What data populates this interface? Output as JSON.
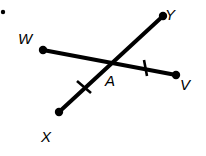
{
  "figure": {
    "title": "Intersecting segments WV and XY meeting at point A",
    "canvas": {
      "width": 206,
      "height": 156
    },
    "colors": {
      "background": "#ffffff",
      "stroke": "#000000",
      "label": "#000000"
    },
    "style": {
      "segment_stroke_width": 4,
      "tick_stroke_width": 2.6,
      "endpoint_radius": 4.2,
      "stray_dot_radius": 2.2,
      "label_font_size": 15
    },
    "points": [
      {
        "id": "W",
        "label": "W",
        "x": 43,
        "y": 50,
        "dot": true,
        "label_x": 25,
        "label_y": 44
      },
      {
        "id": "V",
        "label": "V",
        "x": 176,
        "y": 75,
        "dot": true,
        "label_x": 185,
        "label_y": 90
      },
      {
        "id": "X",
        "label": "X",
        "x": 59,
        "y": 112,
        "dot": true,
        "label_x": 46,
        "label_y": 142
      },
      {
        "id": "Y",
        "label": "Y",
        "x": 163,
        "y": 16,
        "dot": true,
        "label_x": 170,
        "label_y": 20
      },
      {
        "id": "A",
        "label": "A",
        "x": 111,
        "y": 62,
        "dot": false,
        "label_x": 110,
        "label_y": 86
      }
    ],
    "segments": [
      {
        "id": "WV",
        "label": "segment-wv",
        "from": "W",
        "to": "V",
        "x1": 43,
        "y1": 50,
        "x2": 176,
        "y2": 75
      },
      {
        "id": "XY",
        "label": "segment-xy",
        "from": "X",
        "to": "Y",
        "x1": 59,
        "y1": 112,
        "x2": 163,
        "y2": 16
      }
    ],
    "tick_marks": [
      {
        "id": "tick-ax",
        "on_segment": "XY",
        "between": "A-X",
        "cx": 84,
        "cy": 87,
        "x1": 77,
        "y1": 81,
        "x2": 91,
        "y2": 93
      },
      {
        "id": "tick-av",
        "on_segment": "WV",
        "between": "A-V",
        "cx": 145,
        "cy": 68,
        "x1": 144,
        "y1": 60,
        "x2": 147,
        "y2": 76
      }
    ],
    "stray_dot": {
      "id": "stray-dot",
      "x": 3,
      "y": 12
    }
  }
}
